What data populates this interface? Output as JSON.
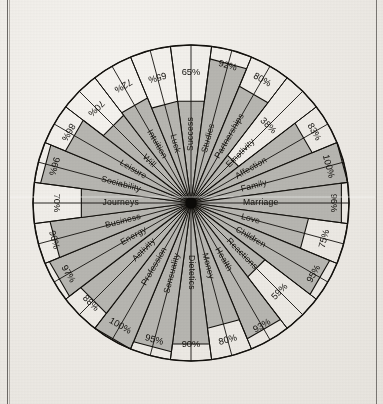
{
  "chart_data": {
    "type": "radar",
    "title": "",
    "subtitle": "",
    "xlabel": "",
    "ylabel": "",
    "ylim": [
      0,
      100
    ],
    "units": "%",
    "grid": false,
    "legend_position": "none",
    "axis_count": 24,
    "start_angle_deg": 90,
    "direction": "clockwise",
    "categories": [
      "Success",
      "Studies",
      "Partnerships",
      "Emotivity",
      "Affection",
      "Family",
      "Marriage",
      "Love",
      "Children",
      "Reactions",
      "Health",
      "Money",
      "Dietetics",
      "Sensuality",
      "Profession",
      "Activity",
      "Energy",
      "Business",
      "Journeys",
      "Sociability",
      "Leisure",
      "Will",
      "Intuition",
      "Luck"
    ],
    "values": [
      65,
      92,
      80,
      38,
      83,
      100,
      96,
      75,
      95,
      59,
      93,
      80,
      90,
      95,
      100,
      88,
      97,
      90,
      70,
      96,
      86,
      70,
      72,
      65
    ],
    "value_labels": [
      "65%",
      "92%",
      "80%",
      "38%",
      "83%",
      "100%",
      "96%",
      "75%",
      "95%",
      "59%",
      "93%",
      "80%",
      "90%",
      "95%",
      "100%",
      "88%",
      "97%",
      "90%",
      "70%",
      "96%",
      "86%",
      "70%",
      "72%",
      "65%"
    ],
    "series": [
      {
        "name": "",
        "values": [
          65,
          92,
          80,
          38,
          83,
          100,
          96,
          75,
          95,
          59,
          93,
          80,
          90,
          95,
          100,
          88,
          97,
          90,
          70,
          96,
          86,
          70,
          72,
          65
        ]
      }
    ]
  },
  "style": {
    "fill_color": "#b8b7b2",
    "stroke_color": "#13110d",
    "outer_ring_color": "#13110d",
    "hub_color": "#0b0a08",
    "page_color": "#efece7"
  }
}
